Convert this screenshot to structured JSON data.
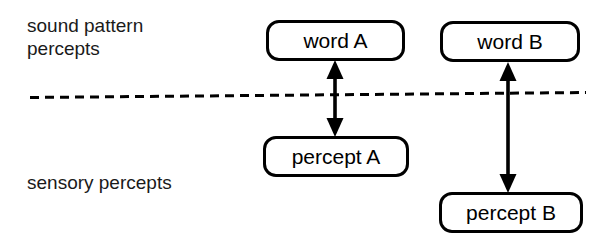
{
  "diagram": {
    "background_color": "#ffffff",
    "stroke_color": "#000000",
    "text_color": "#1a1a1a",
    "width": 609,
    "height": 243,
    "labels": {
      "upper_layer": "sound pattern\npercepts",
      "lower_layer": "sensory percepts"
    },
    "nodes": [
      {
        "id": "word-a",
        "label": "word A",
        "layer": "upper"
      },
      {
        "id": "word-b",
        "label": "word B",
        "layer": "upper"
      },
      {
        "id": "percept-a",
        "label": "percept A",
        "layer": "lower"
      },
      {
        "id": "percept-b",
        "label": "percept B",
        "layer": "lower"
      }
    ],
    "connectors": [
      {
        "id": "arrow-a",
        "from": "word-a",
        "to": "percept-a",
        "style": "double-headed",
        "crosses_divider": true
      },
      {
        "id": "arrow-b",
        "from": "word-b",
        "to": "percept-b",
        "style": "double-headed",
        "crosses_divider": true
      }
    ],
    "divider": {
      "id": "layer-divider",
      "style": "dashed",
      "description": "dashed boundary separating sound pattern percepts from sensory percepts"
    }
  }
}
